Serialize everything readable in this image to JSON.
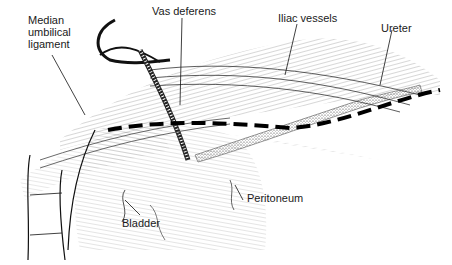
{
  "figure": {
    "type": "anatomical-illustration",
    "line_color": "#1a1a1a",
    "background": "#ffffff",
    "labels": {
      "median_umbilical_ligament": "Median\numbilical\nligament",
      "vas_deferens": "Vas deferens",
      "iliac_vessels": "Iliac vessels",
      "ureter": "Ureter",
      "bladder": "Bladder",
      "peritoneum": "Peritoneum"
    },
    "incision_line": "dashed"
  }
}
